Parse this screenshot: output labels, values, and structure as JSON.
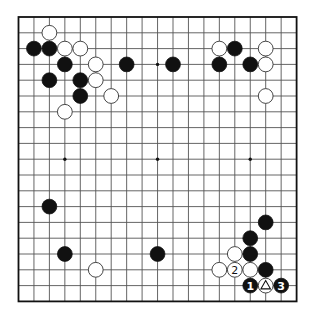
{
  "board": {
    "size": 19,
    "origin_x": 18.5,
    "origin_y": 17,
    "spacing_x": 15.45,
    "spacing_y": 15.8,
    "stone_radius": 7.4,
    "colors": {
      "black": "#111111",
      "white": "#ffffff",
      "grid": "#555555",
      "background": "#ffffff"
    }
  },
  "hoshi": [
    {
      "col": 3,
      "row": 3
    },
    {
      "col": 9,
      "row": 3
    },
    {
      "col": 15,
      "row": 3
    },
    {
      "col": 3,
      "row": 9
    },
    {
      "col": 9,
      "row": 9
    },
    {
      "col": 15,
      "row": 9
    },
    {
      "col": 3,
      "row": 15
    },
    {
      "col": 9,
      "row": 15
    },
    {
      "col": 15,
      "row": 15
    }
  ],
  "stones": [
    {
      "color": "white",
      "col": 2,
      "row": 1
    },
    {
      "color": "black",
      "col": 1,
      "row": 2
    },
    {
      "color": "black",
      "col": 2,
      "row": 2
    },
    {
      "color": "white",
      "col": 3,
      "row": 2
    },
    {
      "color": "white",
      "col": 4,
      "row": 2
    },
    {
      "color": "black",
      "col": 3,
      "row": 3
    },
    {
      "color": "white",
      "col": 5,
      "row": 3
    },
    {
      "color": "black",
      "col": 2,
      "row": 4
    },
    {
      "color": "black",
      "col": 4,
      "row": 4
    },
    {
      "color": "white",
      "col": 5,
      "row": 4
    },
    {
      "color": "black",
      "col": 4,
      "row": 5
    },
    {
      "color": "white",
      "col": 6,
      "row": 5
    },
    {
      "color": "white",
      "col": 3,
      "row": 6
    },
    {
      "color": "black",
      "col": 7,
      "row": 3
    },
    {
      "color": "black",
      "col": 10,
      "row": 3
    },
    {
      "color": "white",
      "col": 13,
      "row": 2
    },
    {
      "color": "black",
      "col": 14,
      "row": 2
    },
    {
      "color": "white",
      "col": 16,
      "row": 2
    },
    {
      "color": "black",
      "col": 13,
      "row": 3
    },
    {
      "color": "black",
      "col": 15,
      "row": 3
    },
    {
      "color": "white",
      "col": 16,
      "row": 3
    },
    {
      "color": "white",
      "col": 16,
      "row": 5
    },
    {
      "color": "black",
      "col": 2,
      "row": 12
    },
    {
      "color": "black",
      "col": 3,
      "row": 15
    },
    {
      "color": "white",
      "col": 5,
      "row": 16
    },
    {
      "color": "black",
      "col": 9,
      "row": 15
    },
    {
      "color": "black",
      "col": 16,
      "row": 13
    },
    {
      "color": "black",
      "col": 15,
      "row": 14
    },
    {
      "color": "white",
      "col": 14,
      "row": 15
    },
    {
      "color": "black",
      "col": 15,
      "row": 15
    },
    {
      "color": "white",
      "col": 13,
      "row": 16
    },
    {
      "color": "white",
      "col": 14,
      "row": 16,
      "label": "2"
    },
    {
      "color": "white",
      "col": 15,
      "row": 16
    },
    {
      "color": "black",
      "col": 16,
      "row": 16
    },
    {
      "color": "black",
      "col": 15,
      "row": 17,
      "label": "1"
    },
    {
      "color": "white",
      "col": 16,
      "row": 17,
      "marker": "triangle"
    },
    {
      "color": "black",
      "col": 17,
      "row": 17,
      "label": "3"
    }
  ],
  "move_labels": [
    "1",
    "2",
    "3"
  ],
  "markers": [
    {
      "type": "triangle",
      "col": 16,
      "row": 17,
      "on": "white"
    }
  ]
}
